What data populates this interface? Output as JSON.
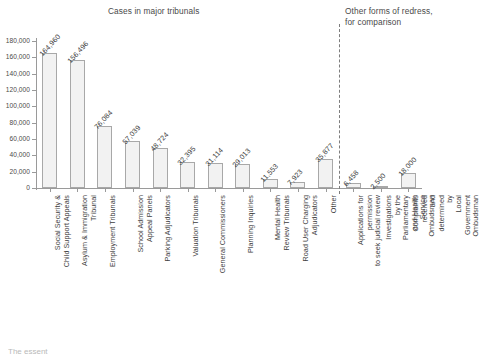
{
  "titles": {
    "left": "Cases in major tribunals",
    "right": "Other forms of redress,\nfor comparison"
  },
  "caption": "The essent",
  "colors": {
    "bar_fill": "#f2f2f2",
    "bar_border": "#a8a8a8",
    "axis": "#9a9a9a",
    "text": "#3d3d3d",
    "divider": "#7d7d7d"
  },
  "chart_data": {
    "type": "bar",
    "title": "Cases in major tribunals",
    "subtitle": "Other forms of redress, for comparison",
    "xlabel": "",
    "ylabel": "",
    "ylim": [
      0,
      180000
    ],
    "grid": false,
    "legend": "none",
    "ytick_labels": [
      "180,000",
      "160,000",
      "140,000",
      "120,000",
      "100,000",
      "80,000",
      "60,000",
      "40,000",
      "20,000",
      "0"
    ],
    "ytick_values": [
      180000,
      160000,
      140000,
      120000,
      100000,
      80000,
      60000,
      40000,
      20000,
      0
    ],
    "divider_after_index": 10,
    "categories": [
      "Social Security &\nChild Support Appeals",
      "Asylum & Immigration\nTribunal",
      "Employment Tribunals",
      "School Admission\nAppeal Panels",
      "Parking Adjudicators",
      "Valuation Tribunals",
      "General Commissioners",
      "Planning Inquiries",
      "Mental Health\nReview Tribunals",
      "Road User Charging\nAdjudicators",
      "Other",
      "Applications for permission\nto seek judicial review",
      "Investigations by the Parliamentary\nand Health Service Ombudsman",
      "Complaints received and determined by\nLocal Government Ombudsman"
    ],
    "values": [
      164960,
      156496,
      76084,
      57039,
      48724,
      32395,
      31114,
      29013,
      11553,
      7923,
      35877,
      6458,
      2500,
      18000
    ],
    "value_labels": [
      "164,960",
      "156,496",
      "76,084",
      "57,039",
      "48,724",
      "32,395",
      "31,114",
      "29,013",
      "11,553",
      "7,923",
      "35,877",
      "6,458",
      "2,500",
      "18,000"
    ]
  }
}
